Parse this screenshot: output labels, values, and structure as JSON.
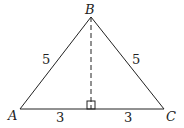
{
  "diagram": {
    "type": "isosceles-triangle",
    "vertices": {
      "A": {
        "label": "A"
      },
      "B": {
        "label": "B"
      },
      "C": {
        "label": "C"
      }
    },
    "sides": {
      "AB": "5",
      "BC": "5",
      "AD": "3",
      "DC": "3"
    },
    "altitude": {
      "from": "B",
      "style": "dashed",
      "right_angle_marker": true
    },
    "colors": {
      "stroke": "#222222",
      "background": "#ffffff"
    }
  }
}
